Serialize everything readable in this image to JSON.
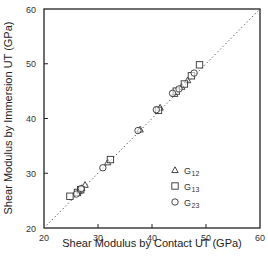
{
  "chart_data": {
    "type": "scatter",
    "title": "",
    "xlabel": "Shear Modulus by Contact UT (GPa)",
    "ylabel": "Shear Modulus by Immersion UT (GPa)",
    "xlim": [
      20,
      60
    ],
    "ylim": [
      20,
      60
    ],
    "xticks": [
      20,
      30,
      40,
      50,
      60
    ],
    "yticks": [
      20,
      30,
      40,
      50,
      60
    ],
    "grid": false,
    "legend_position": "lower right inside",
    "reference_line": {
      "style": "dotted",
      "label": "y = x",
      "from": [
        20,
        20
      ],
      "to": [
        60,
        60
      ]
    },
    "series": [
      {
        "name": "G12",
        "base": "G",
        "sub": "12",
        "marker": "triangle",
        "points": [
          [
            26.5,
            26.8
          ],
          [
            27.0,
            27.3
          ],
          [
            27.6,
            27.9
          ],
          [
            31.8,
            32.0
          ],
          [
            37.8,
            38.0
          ],
          [
            41.5,
            42.0
          ],
          [
            44.2,
            44.5
          ],
          [
            45.5,
            45.8
          ],
          [
            46.6,
            47.0
          ]
        ]
      },
      {
        "name": "G13",
        "base": "G",
        "sub": "13",
        "marker": "square",
        "points": [
          [
            24.8,
            25.8
          ],
          [
            26.2,
            26.5
          ],
          [
            26.8,
            27.0
          ],
          [
            32.3,
            32.5
          ],
          [
            41.2,
            41.5
          ],
          [
            44.5,
            45.0
          ],
          [
            46.0,
            46.3
          ],
          [
            47.3,
            47.8
          ],
          [
            48.8,
            49.8
          ]
        ]
      },
      {
        "name": "G23",
        "base": "G",
        "sub": "23",
        "marker": "circle",
        "points": [
          [
            26.0,
            26.2
          ],
          [
            26.9,
            27.2
          ],
          [
            30.9,
            31.0
          ],
          [
            37.4,
            37.8
          ],
          [
            40.8,
            41.6
          ],
          [
            43.8,
            44.6
          ],
          [
            45.0,
            45.4
          ],
          [
            47.8,
            48.3
          ]
        ]
      }
    ]
  },
  "axes": {
    "x_tick_labels": [
      "20",
      "30",
      "40",
      "50",
      "60"
    ],
    "y_tick_labels": [
      "20",
      "30",
      "40",
      "50",
      "60"
    ],
    "x_title": "Shear Modulus by Contact UT (GPa)",
    "y_title": "Shear Modulus by Immersion UT (GPa)"
  },
  "legend": [
    {
      "marker": "triangle",
      "base": "G",
      "sub": "12"
    },
    {
      "marker": "square",
      "base": "G",
      "sub": "13"
    },
    {
      "marker": "circle",
      "base": "G",
      "sub": "23"
    }
  ],
  "colors": {
    "ink": "#222222",
    "marker_stroke": "#333333",
    "background": "#ffffff"
  }
}
